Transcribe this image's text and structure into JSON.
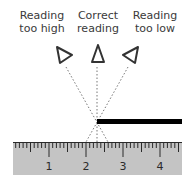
{
  "labels": {
    "too_high": {
      "line1": "Reading",
      "line2": "too high"
    },
    "correct": {
      "line1": "Correct",
      "line2": "reading"
    },
    "too_low": {
      "line1": "Reading",
      "line2": "too low"
    }
  },
  "ruler": {
    "numbers": [
      "1",
      "2",
      "3",
      "4"
    ],
    "fill_color": "#c4c4c4",
    "tick_color": "#2a2a2a"
  },
  "pointer": {
    "color": "#000000"
  },
  "sight_line_color": "#777777"
}
